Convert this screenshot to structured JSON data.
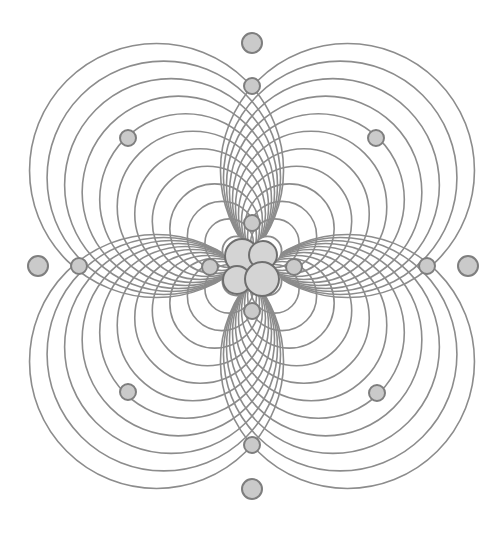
{
  "diagram": {
    "title": "",
    "background": "#ffffff",
    "center": [
      252,
      266
    ],
    "colors": {
      "line": "#8c8c8c",
      "dot_fill": "#cacaca",
      "dot_stroke": "#7e7e7e",
      "core_fill": "#d4d4d4",
      "core_stroke": "#6f6f6f"
    },
    "lobes": {
      "directions": [
        "top-left",
        "top-right",
        "bottom-left",
        "bottom-right"
      ],
      "circle_count": 12,
      "min_radius": 14,
      "max_radius": 127,
      "offset_extra": 8
    },
    "core_circles": [
      {
        "cx": 242,
        "cy": 256,
        "r": 17
      },
      {
        "cx": 263,
        "cy": 255,
        "r": 14
      },
      {
        "cx": 237,
        "cy": 280,
        "r": 14
      },
      {
        "cx": 262,
        "cy": 279,
        "r": 17
      }
    ],
    "inner_satellites": [
      {
        "name": "top",
        "cx": 252,
        "cy": 223,
        "r": 8
      },
      {
        "name": "bottom",
        "cx": 252,
        "cy": 311,
        "r": 8
      },
      {
        "name": "left",
        "cx": 210,
        "cy": 267,
        "r": 8
      },
      {
        "name": "right",
        "cx": 294,
        "cy": 267,
        "r": 8
      }
    ],
    "axis_dots": [
      {
        "name": "top-inner",
        "cx": 252,
        "cy": 86,
        "r": 8
      },
      {
        "name": "top-outer",
        "cx": 252,
        "cy": 43,
        "r": 10
      },
      {
        "name": "bottom-inner",
        "cx": 252,
        "cy": 445,
        "r": 8
      },
      {
        "name": "bottom-outer",
        "cx": 252,
        "cy": 489,
        "r": 10
      },
      {
        "name": "left-inner",
        "cx": 79,
        "cy": 266,
        "r": 8
      },
      {
        "name": "left-outer",
        "cx": 38,
        "cy": 266,
        "r": 10
      },
      {
        "name": "right-inner",
        "cx": 427,
        "cy": 266,
        "r": 8
      },
      {
        "name": "right-outer",
        "cx": 468,
        "cy": 266,
        "r": 10
      }
    ],
    "diagonal_dots": [
      {
        "name": "top-left",
        "cx": 128,
        "cy": 138,
        "r": 8
      },
      {
        "name": "top-right",
        "cx": 376,
        "cy": 138,
        "r": 8
      },
      {
        "name": "bottom-left",
        "cx": 128,
        "cy": 392,
        "r": 8
      },
      {
        "name": "bottom-right",
        "cx": 377,
        "cy": 393,
        "r": 8
      }
    ]
  }
}
